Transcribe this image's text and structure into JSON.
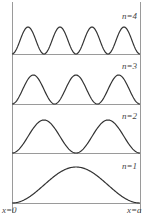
{
  "figure": {
    "frame": {
      "left": 12,
      "right": 140,
      "top": 2,
      "bottom": 203
    },
    "line_color": "#9a9a9a",
    "curve_color": "#333333",
    "panels": [
      {
        "n_label": "n=4",
        "n": 4,
        "baseline": 54,
        "amplitude": 27,
        "label_x": 122,
        "label_y": 12
      },
      {
        "n_label": "n=3",
        "n": 3,
        "baseline": 104,
        "amplitude": 29,
        "label_x": 122,
        "label_y": 62
      },
      {
        "n_label": "n=2",
        "n": 2,
        "baseline": 153,
        "amplitude": 33,
        "label_x": 122,
        "label_y": 112
      },
      {
        "n_label": "n=1",
        "n": 1,
        "baseline": 203,
        "amplitude": 36,
        "label_x": 122,
        "label_y": 162
      }
    ],
    "axis_labels": {
      "left": "x=0",
      "right": "x=a"
    }
  }
}
